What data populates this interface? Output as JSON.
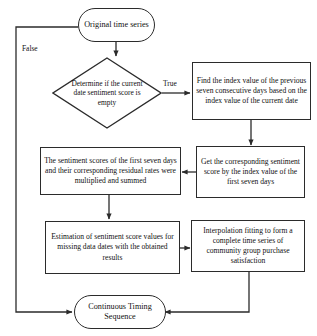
{
  "diagram": {
    "colors": {
      "stroke": "#2b2b2b",
      "background": "#ffffff",
      "text": "#111111"
    },
    "nodes": {
      "start": {
        "label": "Original time series",
        "shape": "terminal"
      },
      "decision": {
        "label": "Determine if the current date sentiment score is empty",
        "shape": "decision"
      },
      "find_index": {
        "label": "Find the index value of the previous seven consecutive days based on the index value of the current date",
        "shape": "process"
      },
      "get_score": {
        "label": "Get the corresponding sentiment score by the index value of the first seven days",
        "shape": "process"
      },
      "multiply_sum": {
        "label": "The sentiment scores of the first seven days and their corresponding residual rates were multiplied and summed",
        "shape": "process"
      },
      "estimation": {
        "label": "Estimation of sentiment score values for missing data dates with the obtained results",
        "shape": "process"
      },
      "interpolation": {
        "label": "Interpolation fitting to form a complete time series of community group purchase satisfaction",
        "shape": "process"
      },
      "end": {
        "label": "Continuous Timing Sequence",
        "shape": "terminal"
      }
    },
    "edge_labels": {
      "true_branch": "True",
      "false_branch": "False"
    }
  }
}
